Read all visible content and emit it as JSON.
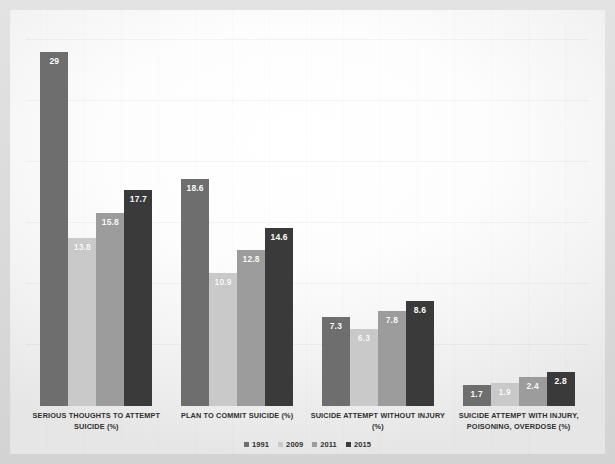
{
  "chart_data": {
    "type": "bar",
    "title": "",
    "subtitle": "",
    "xlabel": "",
    "ylabel": "",
    "grid": true,
    "legend_position": "bottom",
    "ylim": [
      0,
      31
    ],
    "categories": [
      "SERIOUS THOUGHTS TO ATTEMPT SUICIDE (%)",
      "PLAN TO COMMIT SUICIDE (%)",
      "SUICIDE ATTEMPT WITHOUT INJURY (%)",
      "SUICIDE ATTEMPT WITH INJURY, POISONING, OVERDOSE (%)"
    ],
    "series": [
      {
        "name": "1991",
        "color": "#6e6e6e",
        "values": [
          29,
          18.6,
          7.3,
          1.7
        ],
        "labels": [
          "29",
          "18.6",
          "7.3",
          "1.7"
        ]
      },
      {
        "name": "2009",
        "color": "#c9c9c9",
        "values": [
          13.8,
          10.9,
          6.3,
          1.9
        ],
        "labels": [
          "13.8",
          "10.9",
          "6.3",
          "1.9"
        ]
      },
      {
        "name": "2011",
        "color": "#9c9c9c",
        "values": [
          15.8,
          12.8,
          7.8,
          2.4
        ],
        "labels": [
          "15.8",
          "12.8",
          "7.8",
          "2.4"
        ]
      },
      {
        "name": "2015",
        "color": "#3a3a3a",
        "values": [
          17.7,
          14.6,
          8.6,
          2.8
        ],
        "labels": [
          "17.7",
          "14.6",
          "8.6",
          "2.8"
        ]
      }
    ],
    "gridline_values": [
      5,
      10,
      15,
      20,
      25,
      30
    ]
  },
  "colors": {
    "page_background": "#dcdcdc",
    "plot_background": "#ffffff",
    "label_text": "#2f2f2f",
    "value_text": "#ffffff",
    "gridline": "#ededed"
  }
}
